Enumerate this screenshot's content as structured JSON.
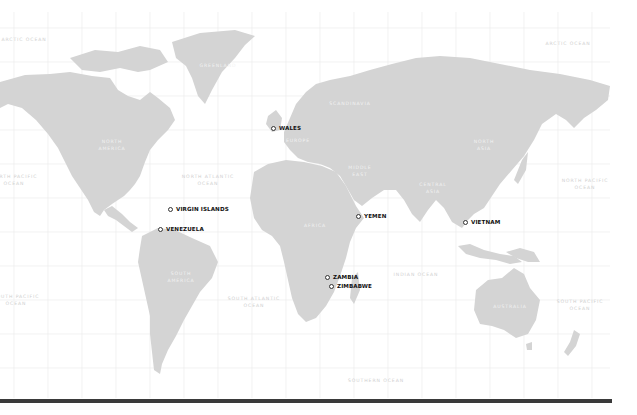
{
  "map": {
    "style": "grayscale world map",
    "colors": {
      "background": "#ffffff",
      "land": "#d4d4d4",
      "grid": "#ececec",
      "marker_text": "#111111",
      "bottom_bar": "#3a3a3a"
    },
    "continent_labels": [
      {
        "id": "greenland",
        "text": "GREENLAND"
      },
      {
        "id": "north-america",
        "text": "NORTH\nAMERICA"
      },
      {
        "id": "south-america",
        "text": "SOUTH\nAMERICA"
      },
      {
        "id": "europe",
        "text": "EUROPE"
      },
      {
        "id": "scandinavia",
        "text": "SCANDINAVIA"
      },
      {
        "id": "africa",
        "text": "AFRICA"
      },
      {
        "id": "middle-east",
        "text": "MIDDLE\nEAST"
      },
      {
        "id": "central-asia",
        "text": "CENTRAL\nASIA"
      },
      {
        "id": "north-asia",
        "text": "NORTH\nASIA"
      },
      {
        "id": "australia",
        "text": "AUSTRALIA"
      }
    ],
    "ocean_labels": [
      {
        "id": "arctic-ocean-west",
        "text": "ARCTIC OCEAN"
      },
      {
        "id": "arctic-ocean-east",
        "text": "ARCTIC OCEAN"
      },
      {
        "id": "north-pacific-west",
        "text": "NORTH PACIFIC\nOCEAN"
      },
      {
        "id": "north-pacific-east",
        "text": "NORTH PACIFIC\nOCEAN"
      },
      {
        "id": "north-atlantic",
        "text": "NORTH ATLANTIC\nOCEAN"
      },
      {
        "id": "south-atlantic",
        "text": "SOUTH ATLANTIC\nOCEAN"
      },
      {
        "id": "south-pacific-west",
        "text": "SOUTH PACIFIC\nOCEAN"
      },
      {
        "id": "south-pacific-east",
        "text": "SOUTH PACIFIC\nOCEAN"
      },
      {
        "id": "indian-ocean",
        "text": "INDIAN OCEAN"
      },
      {
        "id": "southern-ocean",
        "text": "SOUTHERN OCEAN"
      }
    ],
    "markers": [
      {
        "id": "wales",
        "label": "WALES"
      },
      {
        "id": "virgin-islands",
        "label": "VIRGIN ISLANDS"
      },
      {
        "id": "venezuela",
        "label": "VENEZUELA"
      },
      {
        "id": "yemen",
        "label": "YEMEN"
      },
      {
        "id": "vietnam",
        "label": "VIETNAM"
      },
      {
        "id": "zambia",
        "label": "ZAMBIA"
      },
      {
        "id": "zimbabwe",
        "label": "ZIMBABWE"
      }
    ]
  }
}
